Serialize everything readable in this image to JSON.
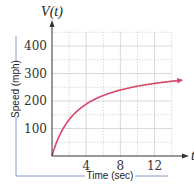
{
  "chart_data": {
    "type": "line",
    "title": "",
    "function_label": "V(t)",
    "x_axis_symbol": "t",
    "xlabel": "Time (sec)",
    "ylabel": "Speed (mph)",
    "xlim": [
      0,
      14
    ],
    "ylim": [
      0,
      450
    ],
    "x_ticks": [
      4,
      8,
      12
    ],
    "y_ticks": [
      100,
      200,
      300,
      400
    ],
    "x_grid_step": 2,
    "y_grid_step": 50,
    "grid": true,
    "legend": null,
    "series": [
      {
        "name": "V(t)",
        "color": "#d9476a",
        "x": [
          0,
          1,
          2,
          3,
          4,
          6,
          8,
          10,
          12,
          14,
          15
        ],
        "values": [
          0,
          83,
          132,
          165,
          189,
          220,
          240,
          254,
          264,
          272,
          275
        ]
      }
    ]
  },
  "colors": {
    "curve": "#d9476a",
    "axis": "#333333",
    "grid": "#c8c8c8",
    "bracket": "#8a9ccf"
  }
}
